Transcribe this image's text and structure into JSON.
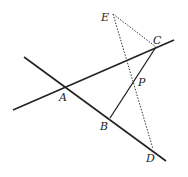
{
  "diagram": {
    "points": {
      "A": {
        "label": "A",
        "x": 64,
        "y": 88
      },
      "B": {
        "label": "B",
        "x": 110,
        "y": 118
      },
      "C": {
        "label": "C",
        "x": 156,
        "y": 47
      },
      "D": {
        "label": "D",
        "x": 153,
        "y": 149
      },
      "E": {
        "label": "E",
        "x": 113,
        "y": 14
      },
      "P": {
        "label": "P",
        "x": 134,
        "y": 83
      }
    },
    "lines": [
      {
        "id": "line-AC",
        "style": "solid",
        "from": [
          13,
          110
        ],
        "to": [
          174,
          40
        ]
      },
      {
        "id": "line-AB",
        "style": "solid",
        "from": [
          24,
          57
        ],
        "to": [
          166,
          161
        ]
      },
      {
        "id": "segment-BC",
        "style": "solid",
        "from": [
          110,
          118
        ],
        "to": [
          156,
          47
        ]
      },
      {
        "id": "segment-EC",
        "style": "dotted",
        "from": [
          113,
          14
        ],
        "to": [
          156,
          47
        ]
      },
      {
        "id": "segment-ED",
        "style": "dotted",
        "from": [
          113,
          14
        ],
        "to": [
          153,
          149
        ]
      }
    ],
    "stroke_color": "#222222"
  }
}
